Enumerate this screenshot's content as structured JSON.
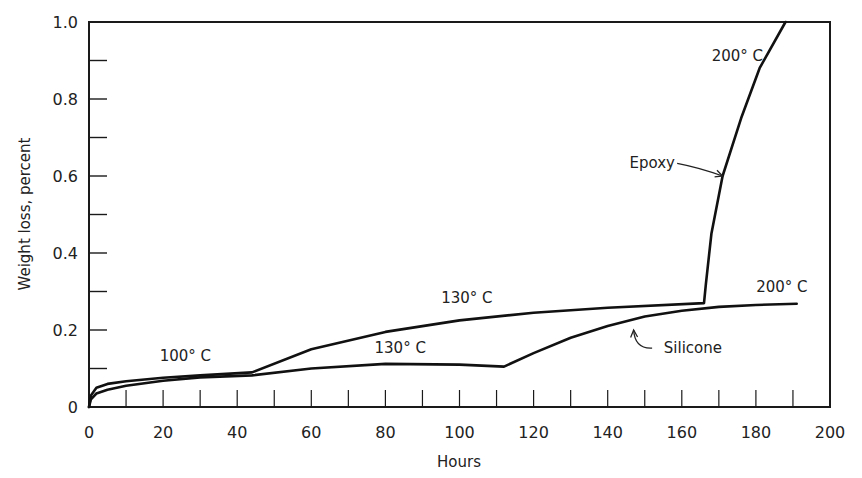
{
  "chart_data": {
    "type": "line",
    "title": "",
    "xlabel": "Hours",
    "ylabel": "Weight loss, percent",
    "xlim": [
      0,
      200
    ],
    "ylim": [
      0,
      1.0
    ],
    "x_ticks": [
      0,
      20,
      40,
      60,
      80,
      100,
      120,
      140,
      160,
      180,
      200
    ],
    "x_tick_labels": [
      "0",
      "20",
      "40",
      "60",
      "80",
      "100",
      "120",
      "140",
      "160",
      "180",
      "200"
    ],
    "x_minor_step": 10,
    "y_ticks": [
      0,
      0.2,
      0.4,
      0.6,
      0.8,
      1.0
    ],
    "y_tick_labels": [
      "0",
      "0.2",
      "0.4",
      "0.6",
      "0.8",
      "1.0"
    ],
    "y_minor_step": 0.1,
    "grid": false,
    "legend": "none (curves labeled directly)",
    "series": [
      {
        "name": "Epoxy",
        "points": [
          [
            0,
            0
          ],
          [
            0.5,
            0.03
          ],
          [
            2,
            0.05
          ],
          [
            5,
            0.06
          ],
          [
            10,
            0.067
          ],
          [
            20,
            0.076
          ],
          [
            30,
            0.082
          ],
          [
            44,
            0.09
          ],
          [
            60,
            0.15
          ],
          [
            80,
            0.195
          ],
          [
            100,
            0.225
          ],
          [
            120,
            0.245
          ],
          [
            140,
            0.258
          ],
          [
            166,
            0.27
          ],
          [
            166.5,
            0.32
          ],
          [
            168,
            0.45
          ],
          [
            171,
            0.6
          ],
          [
            176,
            0.75
          ],
          [
            181,
            0.88
          ],
          [
            188,
            1.0
          ]
        ]
      },
      {
        "name": "Silicone",
        "points": [
          [
            0,
            0
          ],
          [
            0.5,
            0.02
          ],
          [
            2,
            0.035
          ],
          [
            5,
            0.045
          ],
          [
            10,
            0.055
          ],
          [
            20,
            0.068
          ],
          [
            30,
            0.077
          ],
          [
            44,
            0.082
          ],
          [
            60,
            0.1
          ],
          [
            80,
            0.112
          ],
          [
            100,
            0.11
          ],
          [
            112,
            0.105
          ],
          [
            120,
            0.14
          ],
          [
            130,
            0.18
          ],
          [
            140,
            0.21
          ],
          [
            150,
            0.235
          ],
          [
            160,
            0.25
          ],
          [
            170,
            0.26
          ],
          [
            180,
            0.265
          ],
          [
            191,
            0.268
          ]
        ]
      }
    ],
    "annotations": [
      {
        "text": "100° C",
        "x": 26,
        "y": 0.12
      },
      {
        "text": "130° C",
        "x": 102,
        "y": 0.27
      },
      {
        "text": "130° C",
        "x": 84,
        "y": 0.14
      },
      {
        "text": "200° C",
        "x": 175,
        "y": 0.9
      },
      {
        "text": "200° C",
        "x": 187,
        "y": 0.3
      },
      {
        "text": "Epoxy",
        "x": 152,
        "y": 0.62,
        "arrow_to": [
          171,
          0.6
        ]
      },
      {
        "text": "Silicone",
        "x": 163,
        "y": 0.14,
        "arrow_to": [
          147,
          0.2
        ]
      }
    ]
  }
}
